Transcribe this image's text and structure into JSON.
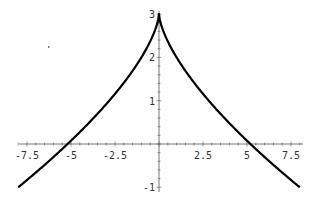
{
  "chart_data": {
    "type": "line",
    "title": "",
    "xlabel": "",
    "ylabel": "",
    "function": "y = 3 - |x|^(2/3)",
    "xlim": [
      -8,
      8
    ],
    "ylim": [
      -1,
      3
    ],
    "grid": false,
    "legend": null,
    "x_ticks": [
      "-7.5",
      "-5",
      "-2.5",
      "2.5",
      "5",
      "7.5"
    ],
    "x_tick_values": [
      -7.5,
      -5,
      -2.5,
      2.5,
      5,
      7.5
    ],
    "y_ticks": [
      "3",
      "2",
      "1",
      "-1"
    ],
    "y_tick_values": [
      3,
      2,
      1,
      -1
    ],
    "series": [
      {
        "name": "curve",
        "color": "#000000",
        "x": [
          -8,
          -7,
          -6,
          -5.2,
          -5,
          -4,
          -3,
          -2.5,
          -2,
          -1,
          -0.5,
          -0.1,
          0,
          0.1,
          0.5,
          1,
          2,
          2.5,
          3,
          4,
          5,
          5.2,
          6,
          7,
          8
        ],
        "y": [
          -1,
          -0.66,
          -0.3,
          0,
          0.08,
          0.48,
          0.92,
          1.16,
          1.41,
          2.0,
          2.37,
          2.78,
          3,
          2.78,
          2.37,
          2.0,
          1.41,
          1.16,
          0.92,
          0.48,
          0.08,
          0,
          -0.3,
          -0.66,
          -1
        ]
      }
    ]
  },
  "colors": {
    "curve": "#000000",
    "axis": "#555555",
    "label": "#333333"
  }
}
